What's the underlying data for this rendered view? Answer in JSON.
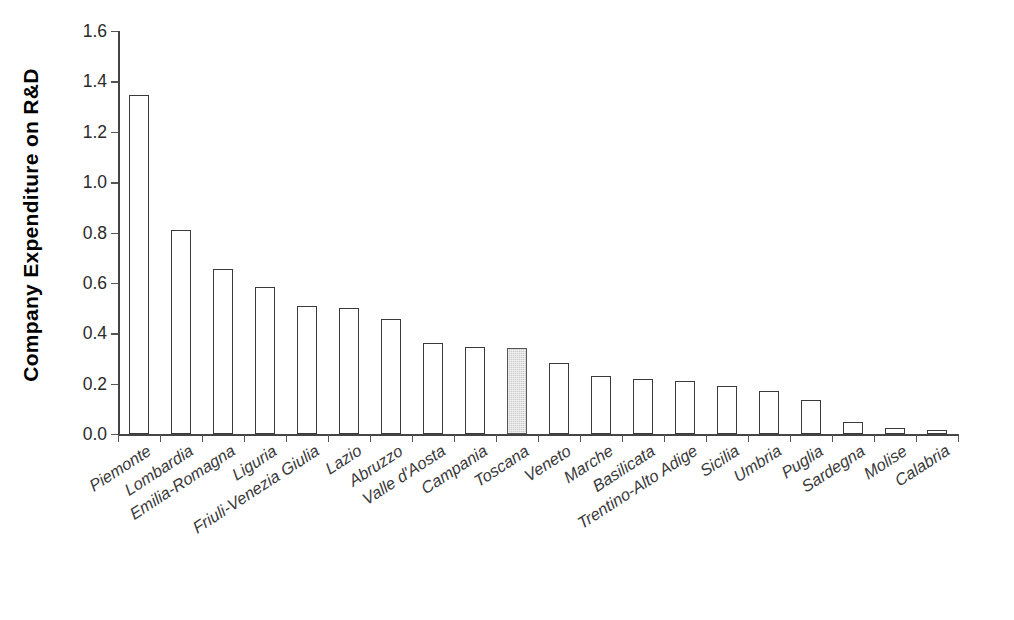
{
  "chart_data": {
    "type": "bar",
    "title": "",
    "subtitle": "",
    "xlabel": "",
    "ylabel": "Company Expenditure on R&D",
    "ylim": [
      0.0,
      1.6
    ],
    "ytick_step": 0.2,
    "ytick_labels": [
      "0.0",
      "0.2",
      "0.4",
      "0.6",
      "0.8",
      "1.0",
      "1.2",
      "1.4",
      "1.6"
    ],
    "ytick_values": [
      0.0,
      0.2,
      0.4,
      0.6,
      0.8,
      1.0,
      1.2,
      1.4,
      1.6
    ],
    "grid": false,
    "legend": null,
    "bar_style": {
      "default_fill": "#ffffff",
      "default_border": "#3a3a3a",
      "highlight_fill": "#cccccc",
      "highlight_border": "#555555"
    },
    "highlight_category": "Toscana",
    "categories": [
      "Piemonte",
      "Lombardia",
      "Emilia-Romagna",
      "Liguria",
      "Friuli-Venezia Giulia",
      "Lazio",
      "Abruzzo",
      "Valle d'Aosta",
      "Campania",
      "Toscana",
      "Veneto",
      "Marche",
      "Basilicata",
      "Trentino-Alto Adige",
      "Sicilia",
      "Umbria",
      "Puglia",
      "Sardegna",
      "Molise",
      "Calabria"
    ],
    "values": [
      1.345,
      0.81,
      0.655,
      0.585,
      0.51,
      0.5,
      0.455,
      0.36,
      0.345,
      0.34,
      0.28,
      0.23,
      0.22,
      0.21,
      0.19,
      0.17,
      0.135,
      0.048,
      0.025,
      0.017
    ],
    "highlighted": [
      false,
      false,
      false,
      false,
      false,
      false,
      false,
      false,
      false,
      true,
      false,
      false,
      false,
      false,
      false,
      false,
      false,
      false,
      false,
      false
    ]
  }
}
